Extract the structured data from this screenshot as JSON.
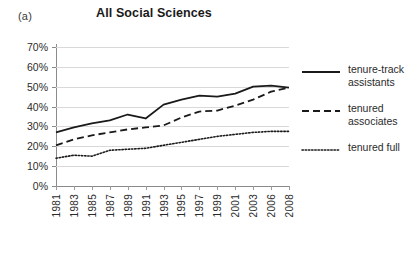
{
  "panel_label": "(a)",
  "title": "All Social Sciences",
  "axes": {
    "y_ticks": [
      "70%",
      "60%",
      "50%",
      "40%",
      "30%",
      "20%",
      "10%",
      "0%"
    ],
    "x_ticks": [
      "1981",
      "1983",
      "1985",
      "1987",
      "1989",
      "1991",
      "1993",
      "1995",
      "1997",
      "1999",
      "2001",
      "2003",
      "2006",
      "2008"
    ]
  },
  "legend": {
    "items": [
      {
        "label_line1": "tenure-track",
        "label_line2": "assistants",
        "style": "solid",
        "name": "legend-item-tenure-track-assistants"
      },
      {
        "label_line1": "tenured",
        "label_line2": "associates",
        "style": "dashed",
        "name": "legend-item-tenured-associates"
      },
      {
        "label_line1": "tenured full",
        "label_line2": "",
        "style": "dotted",
        "name": "legend-item-tenured-full"
      }
    ]
  },
  "colors": {
    "line": "#1a1a1a",
    "grid": "#d9d9d9",
    "axis": "#8a8a8a",
    "text": "#2b2b2b",
    "background": "#ffffff"
  },
  "chart_data": {
    "type": "line",
    "title": "All Social Sciences",
    "xlabel": "",
    "ylabel": "",
    "ylim": [
      0,
      70
    ],
    "ytick_values": [
      0,
      10,
      20,
      30,
      40,
      50,
      60,
      70
    ],
    "yunit": "percent",
    "grid": true,
    "legend_position": "right",
    "x": [
      "1981",
      "1983",
      "1985",
      "1987",
      "1989",
      "1991",
      "1993",
      "1995",
      "1997",
      "1999",
      "2001",
      "2003",
      "2006",
      "2008"
    ],
    "series": [
      {
        "name": "tenure-track assistants",
        "style": "solid",
        "values": [
          27.0,
          29.5,
          31.5,
          33.0,
          36.0,
          34.0,
          41.0,
          43.5,
          45.5,
          45.0,
          46.5,
          50.0,
          50.5,
          49.5
        ]
      },
      {
        "name": "tenured associates",
        "style": "dashed",
        "values": [
          20.5,
          23.5,
          25.5,
          27.0,
          28.5,
          29.5,
          30.5,
          34.5,
          37.5,
          38.0,
          40.5,
          43.5,
          47.5,
          49.5
        ]
      },
      {
        "name": "tenured full",
        "style": "dotted",
        "values": [
          14.0,
          15.5,
          15.0,
          18.0,
          18.5,
          19.0,
          20.5,
          22.0,
          23.5,
          25.0,
          26.0,
          27.0,
          27.5,
          27.5
        ]
      }
    ]
  }
}
